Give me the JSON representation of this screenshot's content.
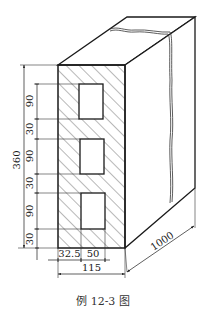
{
  "figure": {
    "caption": "例 12-3 图",
    "colors": {
      "line": "#1a1a1a",
      "background": "#ffffff",
      "caption": "#333333"
    }
  },
  "dimensions": {
    "height_total": "360",
    "vertical_segments": [
      "90",
      "30",
      "90",
      "30",
      "90",
      "30"
    ],
    "width_left_offset": "32.5",
    "width_hole": "50",
    "width_total": "115",
    "length": "1000"
  },
  "holes": {
    "count": 3
  }
}
